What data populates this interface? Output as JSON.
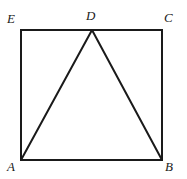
{
  "figure": {
    "kind": "plane-geometry-diagram",
    "background_color": "#ffffff",
    "stroke_color": "#1a1a1a",
    "stroke_width": 2,
    "canvas": {
      "width": 187,
      "height": 179
    },
    "square": {
      "name": "outer-square",
      "left": 21,
      "top": 30,
      "right": 162,
      "bottom": 160,
      "corners": [
        {
          "id": "E",
          "x": 21,
          "y": 30
        },
        {
          "id": "C",
          "x": 162,
          "y": 30
        },
        {
          "id": "B",
          "x": 162,
          "y": 160
        },
        {
          "id": "A",
          "x": 21,
          "y": 160
        }
      ]
    },
    "triangle": {
      "name": "inner-triangle",
      "vertices": [
        {
          "id": "A",
          "x": 21,
          "y": 160
        },
        {
          "id": "D",
          "x": 92,
          "y": 30
        },
        {
          "id": "B",
          "x": 162,
          "y": 160
        }
      ]
    },
    "points": [
      {
        "id": "D",
        "x": 92,
        "y": 30,
        "on": "top-edge"
      }
    ],
    "labels": [
      {
        "id": "E",
        "text": "E",
        "anchor": "top-left-outside"
      },
      {
        "id": "D",
        "text": "D",
        "anchor": "top-center-outside"
      },
      {
        "id": "C",
        "text": "C",
        "anchor": "top-right-outside"
      },
      {
        "id": "A",
        "text": "A",
        "anchor": "bottom-left-outside"
      },
      {
        "id": "B",
        "text": "B",
        "anchor": "bottom-right-outside"
      }
    ]
  }
}
